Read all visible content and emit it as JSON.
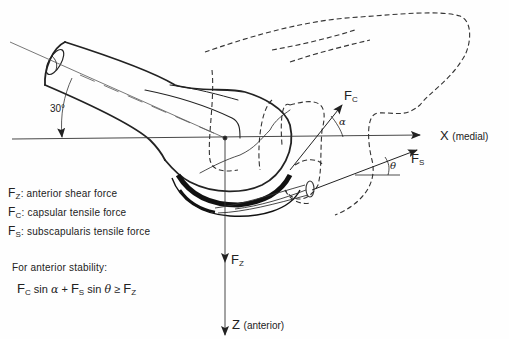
{
  "diagram": {
    "angle_label": "30°",
    "axes": {
      "x": {
        "name": "X",
        "qualifier": "(medial)"
      },
      "z": {
        "name": "Z",
        "qualifier": "(anterior)"
      }
    },
    "forces": {
      "fc": {
        "symbol": "F",
        "sub": "C"
      },
      "fs": {
        "symbol": "F",
        "sub": "S"
      },
      "fz": {
        "symbol": "F",
        "sub": "Z"
      }
    },
    "angles": {
      "alpha": "α",
      "theta": "θ"
    },
    "legend": [
      {
        "symbol": "F",
        "sub": "Z",
        "text": ": anterior shear force"
      },
      {
        "symbol": "F",
        "sub": "C",
        "text": ": capsular tensile force"
      },
      {
        "symbol": "F",
        "sub": "S",
        "text": ": subscapularis tensile force"
      }
    ],
    "stability": {
      "heading": "For anterior stability:",
      "formula": {
        "t1_sym": "F",
        "t1_sub": "C",
        "t1_fn": " sin ",
        "t1_ang": "α",
        "plus": " + ",
        "t2_sym": "F",
        "t2_sub": "S",
        "t2_fn": " sin ",
        "t2_ang": "θ",
        "rel": " ≥ ",
        "t3_sym": "F",
        "t3_sub": "Z"
      }
    },
    "colors": {
      "ink": "#222222",
      "background": "#fefefe"
    }
  }
}
